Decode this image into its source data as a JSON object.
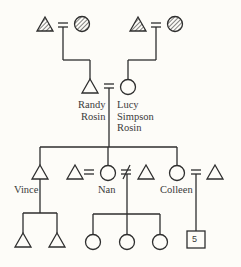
{
  "diagram": {
    "type": "kinship-chart",
    "colors": {
      "line": "#2e2e2e",
      "background": "#fdfcf8",
      "text": "#3a3a3a"
    },
    "symbols": {
      "male": "triangle",
      "female": "circle",
      "unknown_group": "square",
      "deceased_or_hatched": "hatched-fill",
      "marriage": "=",
      "divorce": "≠"
    },
    "generation_1": [
      {
        "id": "pgf",
        "sex": "male",
        "hatched": true
      },
      {
        "id": "pgm",
        "sex": "female",
        "hatched": true
      },
      {
        "id": "mgf",
        "sex": "male",
        "hatched": true
      },
      {
        "id": "mgm",
        "sex": "female",
        "hatched": true
      }
    ],
    "generation_2": {
      "randy": {
        "line1": "Randy",
        "line2": "Rosin"
      },
      "lucy": {
        "line1": "Lucy",
        "line2": "Simpson",
        "line3": "Rosin"
      }
    },
    "generation_3": {
      "vince": "Vince",
      "nan": "Nan",
      "colleen": "Colleen"
    },
    "generation_4": {
      "vince_children": 2,
      "nan_children": 3,
      "colleen_children_label": "5"
    }
  }
}
